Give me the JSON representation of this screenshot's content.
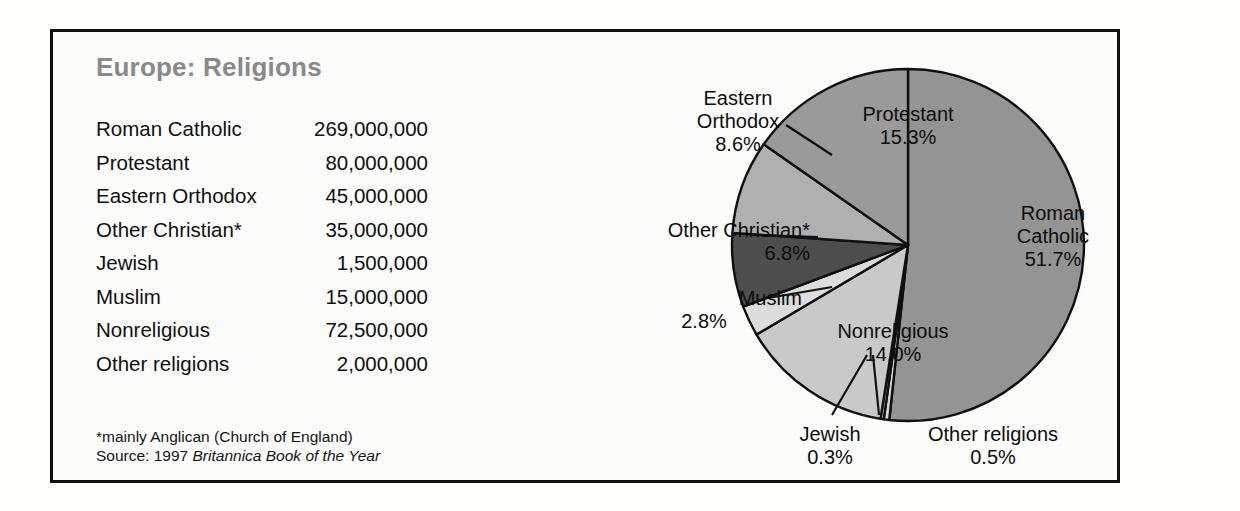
{
  "chart_title": "Europe: Religions",
  "table": {
    "rows": [
      {
        "label": "Roman Catholic",
        "value": "269,000,000"
      },
      {
        "label": "Protestant",
        "value": "80,000,000"
      },
      {
        "label": "Eastern Orthodox",
        "value": "45,000,000"
      },
      {
        "label": "Other Christian*",
        "value": "35,000,000"
      },
      {
        "label": "Jewish",
        "value": "1,500,000"
      },
      {
        "label": "Muslim",
        "value": "15,000,000"
      },
      {
        "label": "Nonreligious",
        "value": "72,500,000"
      },
      {
        "label": "Other religions",
        "value": "2,000,000"
      }
    ]
  },
  "footnotes": {
    "note": "*mainly Anglican (Church of England)",
    "source_prefix": "Source: 1997 ",
    "source_italic": "Britannica Book of the Year"
  },
  "labels": {
    "eastern_orthodox_name": "Eastern",
    "eastern_orthodox_name2": "Orthodox",
    "eastern_orthodox_pct": "8.6%",
    "protestant_name": "Protestant",
    "protestant_pct": "15.3%",
    "roman_catholic_name": "Roman",
    "roman_catholic_name2": "Catholic",
    "roman_catholic_pct": "51.7%",
    "other_christian_name": "Other Christian*",
    "other_christian_pct": "6.8%",
    "muslim_name": "Muslim",
    "muslim_pct": "2.8%",
    "nonreligious_name": "Nonreligious",
    "nonreligious_pct": "14.0%",
    "jewish_name": "Jewish",
    "jewish_pct": "0.3%",
    "other_religions_name": "Other religions",
    "other_religions_pct": "0.5%"
  },
  "chart_data": {
    "type": "pie",
    "title": "Europe: Religions",
    "subtitle": "",
    "xlabel": "",
    "ylabel": "",
    "unit": "percent of population",
    "start_angle_deg": 0,
    "direction": "clockwise",
    "legend": "none (labels placed on/around slices)",
    "grid": false,
    "categories": [
      "Roman Catholic",
      "Other religions",
      "Jewish",
      "Nonreligious",
      "Muslim",
      "Other Christian*",
      "Eastern Orthodox",
      "Protestant"
    ],
    "values": [
      51.7,
      0.5,
      0.3,
      14.0,
      2.8,
      6.8,
      8.6,
      15.3
    ],
    "counts": [
      269000000,
      2000000,
      1500000,
      72500000,
      15000000,
      35000000,
      45000000,
      80000000
    ],
    "slice_colors": [
      "#949494",
      "#d6d6d6",
      "#b8b8b8",
      "#c9c9c9",
      "#dcdcdc",
      "#4d4d4d",
      "#b0b0b0",
      "#9a9a9a"
    ],
    "annotations": [
      "*mainly Anglican (Church of England)",
      "Source: 1997 Britannica Book of the Year"
    ]
  },
  "colors": {
    "frame": "#111111",
    "title": "#8a8a8a",
    "text": "#101010",
    "pie_outline": "#101010",
    "shadow": "#c2c2c2"
  }
}
